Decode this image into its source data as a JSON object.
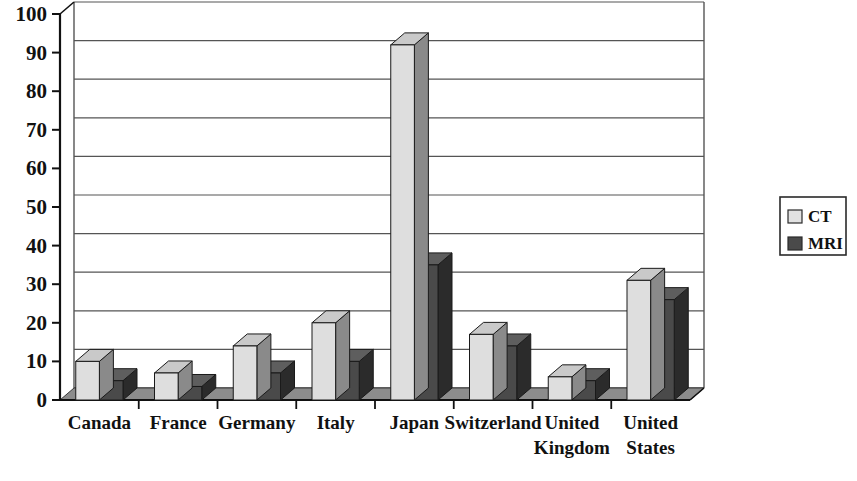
{
  "chart_data": {
    "type": "bar",
    "title": "",
    "subtitle": "",
    "xlabel": "",
    "ylabel": "",
    "ylim": [
      0,
      100
    ],
    "ytick_step": 10,
    "yticks": [
      "0",
      "10",
      "20",
      "30",
      "40",
      "50",
      "60",
      "70",
      "80",
      "90",
      "100"
    ],
    "grid": "horizontal",
    "legend_position": "right",
    "style": "3d-grouped-bars",
    "categories": [
      "Canada",
      "France",
      "Germany",
      "Italy",
      "Japan",
      "Switzerland",
      "United Kingdom",
      "United States"
    ],
    "series": [
      {
        "name": "CT",
        "color": "#dedede",
        "side_color": "#8a8a8a",
        "top_color": "#c9c9c9",
        "values": [
          10,
          7,
          14,
          20,
          92,
          17,
          6,
          31
        ]
      },
      {
        "name": "MRI",
        "color": "#4a4a4a",
        "side_color": "#2b2b2b",
        "top_color": "#5e5e5e",
        "values": [
          5,
          3.5,
          7,
          10,
          35,
          14,
          5,
          26
        ]
      }
    ]
  },
  "legend": {
    "entries": [
      {
        "label": "CT",
        "swatch": "#e2e2e2"
      },
      {
        "label": "MRI",
        "swatch": "#4a4a4a"
      }
    ]
  },
  "colors": {
    "axis": "#111111",
    "gridline": "#555555",
    "floor": "#8c8c8c",
    "background": "#ffffff",
    "text": "#111111"
  }
}
